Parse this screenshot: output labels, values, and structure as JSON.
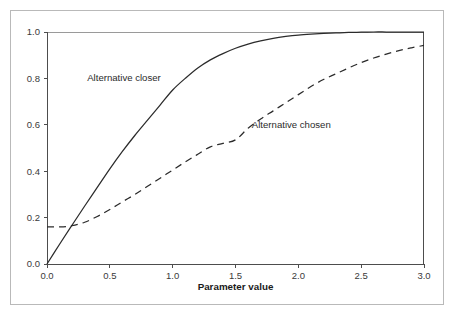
{
  "figure": {
    "background_color": "#ffffff",
    "frame_color": "#b9b9b9",
    "axis_color": "#4d4d4d",
    "series_color": "#2b2b2b"
  },
  "chart_data": {
    "type": "line",
    "title": "",
    "xlabel": "Parameter value",
    "ylabel": "",
    "xlim": [
      0.0,
      3.0
    ],
    "ylim": [
      0.0,
      1.0
    ],
    "grid": false,
    "legend_position": "inline-annotations",
    "xticks": [
      "0.0",
      "0.5",
      "1.0",
      "1.5",
      "2.0",
      "2.5",
      "3.0"
    ],
    "xtick_values": [
      0.0,
      0.5,
      1.0,
      1.5,
      2.0,
      2.5,
      3.0
    ],
    "yticks": [
      "0.0",
      "0.2",
      "0.4",
      "0.6",
      "0.8",
      "1.0"
    ],
    "ytick_values": [
      0.0,
      0.2,
      0.4,
      0.6,
      0.8,
      1.0
    ],
    "x": [
      0.0,
      0.1,
      0.2,
      0.3,
      0.4,
      0.5,
      0.6,
      0.7,
      0.8,
      0.9,
      1.0,
      1.1,
      1.2,
      1.3,
      1.4,
      1.5,
      1.6,
      1.7,
      1.8,
      1.9,
      2.0,
      2.1,
      2.2,
      2.3,
      2.4,
      2.5,
      2.6,
      2.7,
      2.8,
      2.9,
      3.0
    ],
    "series": [
      {
        "name": "Alternative closer",
        "style": "solid",
        "annotation_label": "Alternative closer",
        "values": [
          0.0,
          0.085,
          0.168,
          0.25,
          0.33,
          0.41,
          0.485,
          0.555,
          0.62,
          0.685,
          0.75,
          0.8,
          0.845,
          0.88,
          0.907,
          0.93,
          0.948,
          0.962,
          0.973,
          0.981,
          0.987,
          0.991,
          0.994,
          0.996,
          0.998,
          0.999,
          1.0,
          1.0,
          1.0,
          1.0,
          1.0
        ]
      },
      {
        "name": "Alternative chosen",
        "style": "dashed",
        "annotation_label": "Alternative chosen",
        "values": [
          0.16,
          0.16,
          0.165,
          0.18,
          0.205,
          0.235,
          0.268,
          0.3,
          0.335,
          0.37,
          0.405,
          0.44,
          0.473,
          0.505,
          0.52,
          0.535,
          0.585,
          0.625,
          0.66,
          0.695,
          0.73,
          0.765,
          0.795,
          0.82,
          0.845,
          0.868,
          0.888,
          0.905,
          0.92,
          0.932,
          0.942
        ]
      }
    ],
    "annotations": [
      {
        "text": "Alternative closer",
        "x": 0.32,
        "y": 0.79
      },
      {
        "text": "Alternative chosen",
        "x": 1.63,
        "y": 0.585
      }
    ]
  }
}
